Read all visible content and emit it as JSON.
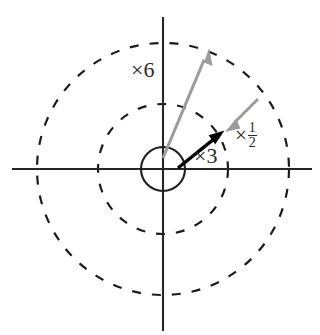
{
  "figure": {
    "background_color": "#ffffff",
    "width": 320,
    "height": 335,
    "center": {
      "x": 163,
      "y": 169
    }
  },
  "axes": {
    "horizontal": {
      "x1": 12,
      "y1": 169,
      "x2": 312,
      "y2": 169,
      "color": "#262626"
    },
    "vertical": {
      "x1": 163,
      "y1": 17,
      "x2": 163,
      "y2": 331,
      "color": "#262626"
    }
  },
  "circles": [
    {
      "name": "unit-circle",
      "radius": 22,
      "style": "solid",
      "color": "#1f1f1f"
    },
    {
      "name": "inner-dashed-circle",
      "radius": 65,
      "style": "dashed",
      "color": "#1c1c1c"
    },
    {
      "name": "outer-dashed-circle",
      "radius": 126,
      "style": "dashed",
      "color": "#1c1c1c"
    }
  ],
  "vectors": [
    {
      "id": "vector-x6",
      "label": "×6",
      "color": "#9c9c9c",
      "from": {
        "x": 163,
        "y": 158
      },
      "to": {
        "x": 209,
        "y": 48
      },
      "label_position": {
        "x": 131,
        "y": 59
      }
    },
    {
      "id": "vector-x3",
      "label": "×3",
      "color": "#000000",
      "from": {
        "x": 178,
        "y": 168
      },
      "to": {
        "x": 224,
        "y": 131
      },
      "label_position": {
        "x": 194,
        "y": 145
      }
    },
    {
      "id": "vector-xhalf",
      "label": "×½",
      "times_sign": "×",
      "numerator": "1",
      "denominator": "2",
      "color": "#9c9c9c",
      "from": {
        "x": 258,
        "y": 99
      },
      "to": {
        "x": 225,
        "y": 132
      },
      "label_position": {
        "x": 235,
        "y": 121
      }
    }
  ]
}
